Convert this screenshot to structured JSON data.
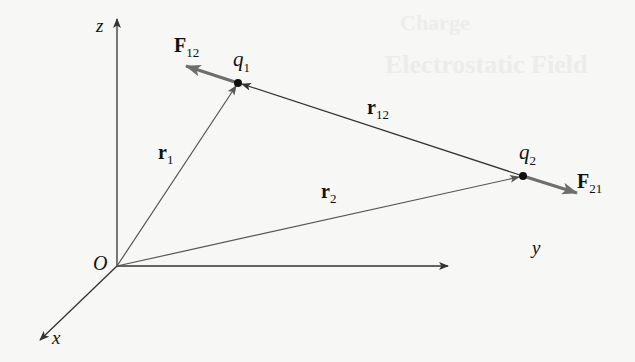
{
  "figure": {
    "background_color": "#f7f7f5",
    "ghost_text": [
      "Charge",
      "Electrostatic Field"
    ],
    "axes": {
      "origin_label": "O",
      "x_label": "x",
      "y_label": "y",
      "z_label": "z"
    },
    "charges": [
      {
        "id": "q1",
        "symbol": "q",
        "subscript": "1"
      },
      {
        "id": "q2",
        "symbol": "q",
        "subscript": "2"
      }
    ],
    "vectors": {
      "r1": {
        "symbol": "r",
        "subscript": "1"
      },
      "r2": {
        "symbol": "r",
        "subscript": "2"
      },
      "r12": {
        "symbol": "r",
        "subscript": "12"
      },
      "F12": {
        "symbol": "F",
        "subscript": "12"
      },
      "F21": {
        "symbol": "F",
        "subscript": "21"
      }
    },
    "colors": {
      "axis": "#333333",
      "position_vector": "#555555",
      "force_vector": "#6e6e6e",
      "charge_dot": "#111111"
    }
  }
}
